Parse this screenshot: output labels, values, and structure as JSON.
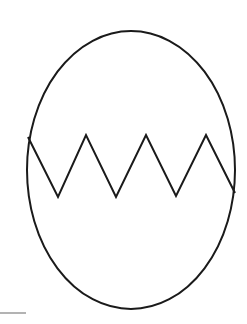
{
  "figure": {
    "stroke_color": "#1a1a1a",
    "baseline_color": "#9a9a9a",
    "background": "#ffffff",
    "ellipse": {
      "cx": 131,
      "cy": 170,
      "rx": 104,
      "ry": 139
    },
    "zigzag_points": "28,137 58,197 86,135 116,197 146,135 176,196 206,135 235,193",
    "baseline": {
      "x1": 0,
      "y1": 313,
      "x2": 26,
      "y2": 313
    }
  }
}
